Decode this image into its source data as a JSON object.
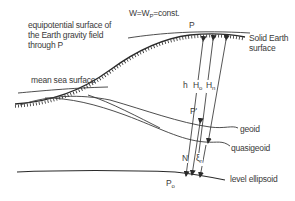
{
  "diagram": {
    "title_equation": {
      "prefix": "W=W",
      "subscript": "P",
      "suffix": "=const."
    },
    "labels": {
      "equipotential_line1": "equipotential surface of",
      "equipotential_line2": "the Earth gravity field",
      "equipotential_line3": "through P",
      "point_P": "P",
      "solid_earth_line1": "Solid Earth",
      "solid_earth_line2": "surface",
      "mean_sea_surface": "mean sea surface",
      "h": "h",
      "H_o": {
        "main": "H",
        "sub": "o"
      },
      "H_n": {
        "main": "H",
        "sub": "n"
      },
      "point_P_prime": "P'",
      "geoid": "geoid",
      "quasigeoid": "quasigeoid",
      "N": "N",
      "xi": {
        "main": "ξ",
        "sub": "n"
      },
      "point_P0": {
        "main": "P",
        "sub": "o"
      },
      "level_ellipsoid": "level ellipsoid"
    },
    "colors": {
      "line": "#3a3a3a",
      "background": "#ffffff"
    }
  }
}
